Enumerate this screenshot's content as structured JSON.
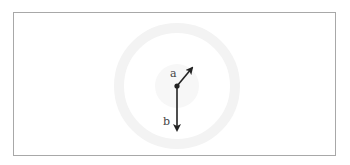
{
  "diagram": {
    "type": "vector-diagram",
    "origin": {
      "x": 177,
      "y": 86
    },
    "vectors": [
      {
        "label": "a",
        "direction": "up-right",
        "tip": {
          "x": 193,
          "y": 67
        },
        "label_pos": {
          "x": 170,
          "y": 77
        }
      },
      {
        "label": "b",
        "direction": "down",
        "tip": {
          "x": 177,
          "y": 131
        },
        "label_pos": {
          "x": 163,
          "y": 125
        }
      }
    ],
    "colors": {
      "arrow": "#222222",
      "frame": "#a8a8a8",
      "watermark": "#f4f4f4"
    }
  }
}
